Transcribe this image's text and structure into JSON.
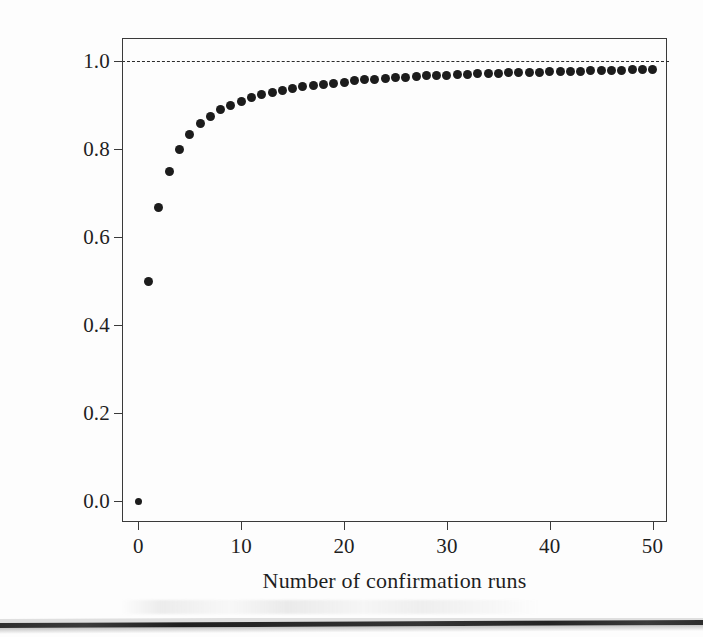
{
  "figure": {
    "caption_band": "scan-artifact-band"
  },
  "chart_data": {
    "type": "scatter",
    "title": "",
    "xlabel": "Number of confirmation runs",
    "ylabel": "Probability of detecting an issue",
    "xlim": [
      -1.5,
      51.5
    ],
    "ylim": [
      -0.05,
      1.05
    ],
    "grid": false,
    "legend": null,
    "marker": {
      "shape": "circle",
      "color": "#1c1c1c",
      "size": 9
    },
    "annotations": [
      {
        "kind": "hline",
        "y": 1.0,
        "style": "dashed",
        "color": "#2b2b2b",
        "label": "asymptote at 1.0"
      }
    ],
    "xticks": [
      0,
      10,
      20,
      30,
      40,
      50
    ],
    "xticklabels": [
      "0",
      "10",
      "20",
      "30",
      "40",
      "50"
    ],
    "yticks": [
      0.0,
      0.2,
      0.4,
      0.6,
      0.8,
      1.0
    ],
    "yticklabels": [
      "0.0",
      "0.2",
      "0.4",
      "0.6",
      "0.8",
      "1.0"
    ],
    "series": [
      {
        "name": "Probability of detecting an issue",
        "formula": "1 - 1/(n+1)",
        "x": [
          0,
          1,
          2,
          3,
          4,
          5,
          6,
          7,
          8,
          9,
          10,
          11,
          12,
          13,
          14,
          15,
          16,
          17,
          18,
          19,
          20,
          21,
          22,
          23,
          24,
          25,
          26,
          27,
          28,
          29,
          30,
          31,
          32,
          33,
          34,
          35,
          36,
          37,
          38,
          39,
          40,
          41,
          42,
          43,
          44,
          45,
          46,
          47,
          48,
          49,
          50
        ],
        "y": [
          0.0,
          0.5,
          0.667,
          0.75,
          0.8,
          0.833,
          0.857,
          0.875,
          0.889,
          0.9,
          0.909,
          0.917,
          0.923,
          0.929,
          0.933,
          0.938,
          0.941,
          0.944,
          0.947,
          0.95,
          0.952,
          0.955,
          0.957,
          0.958,
          0.96,
          0.962,
          0.963,
          0.964,
          0.966,
          0.967,
          0.968,
          0.969,
          0.97,
          0.971,
          0.971,
          0.972,
          0.973,
          0.974,
          0.974,
          0.975,
          0.976,
          0.976,
          0.977,
          0.977,
          0.978,
          0.978,
          0.979,
          0.979,
          0.98,
          0.98,
          0.98
        ]
      }
    ]
  }
}
